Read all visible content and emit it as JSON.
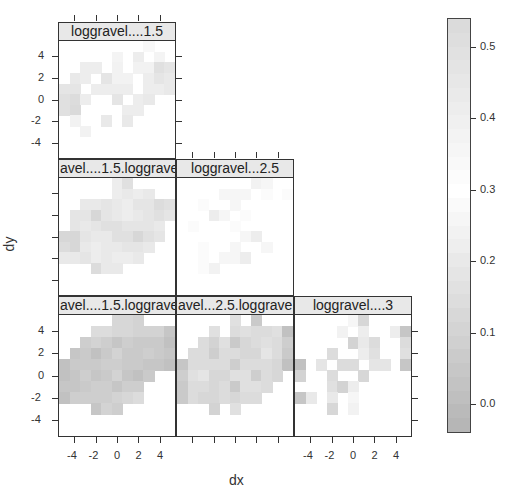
{
  "chart_data": {
    "type": "heatmap",
    "layout": "lower-triangular scatterplot-matrix of variogram-map panels",
    "xlabel": "dx",
    "ylabel": "dy",
    "x_ticks": [
      -4,
      -2,
      0,
      2,
      4
    ],
    "y_ticks": [
      -4,
      -2,
      0,
      2,
      4
    ],
    "axis_range": [
      -5.5,
      5.5
    ],
    "colorbar": {
      "ticks": [
        0.0,
        0.1,
        0.2,
        0.3,
        0.4,
        0.5
      ],
      "range": [
        -0.04,
        0.54
      ],
      "low_color": "#b4b4b4",
      "high_color": "#d9d9d9",
      "mid_color": "#ffffff"
    },
    "panels": [
      {
        "title": "loggravel....1.5",
        "row": 0,
        "col": 0,
        "grid_note": "rows top(dy=5) to bottom(dy=-5), cols left(dx=-5) to right(dx=5)",
        "values": [
          [
            null,
            null,
            null,
            null,
            null,
            null,
            null,
            null,
            0.27,
            null,
            null
          ],
          [
            null,
            null,
            null,
            null,
            null,
            0.25,
            null,
            0.22,
            null,
            0.25,
            null
          ],
          [
            null,
            null,
            0.22,
            0.22,
            null,
            0.24,
            null,
            0.24,
            0.24,
            0.16,
            0.18
          ],
          [
            null,
            0.2,
            0.22,
            null,
            0.18,
            0.24,
            0.24,
            null,
            0.22,
            0.18,
            0.2
          ],
          [
            0.18,
            0.18,
            null,
            0.22,
            0.22,
            0.22,
            0.22,
            null,
            0.22,
            0.22,
            0.2
          ],
          [
            0.16,
            0.14,
            0.22,
            null,
            null,
            0.18,
            null,
            0.22,
            0.2,
            null,
            null
          ],
          [
            0.16,
            0.13,
            null,
            null,
            null,
            null,
            0.22,
            0.22,
            null,
            null,
            null
          ],
          [
            null,
            0.24,
            null,
            null,
            0.2,
            null,
            0.2,
            null,
            null,
            null,
            null
          ],
          [
            null,
            null,
            0.24,
            null,
            null,
            null,
            null,
            null,
            null,
            null,
            null
          ],
          [
            null,
            null,
            null,
            null,
            null,
            null,
            null,
            null,
            null,
            null,
            null
          ],
          [
            null,
            null,
            null,
            null,
            null,
            null,
            null,
            null,
            null,
            null,
            null
          ]
        ]
      },
      {
        "title": "avel....1.5.loggrave",
        "row": 1,
        "col": 0,
        "values": [
          [
            null,
            null,
            null,
            null,
            null,
            0.22,
            0.16,
            null,
            null,
            null,
            null
          ],
          [
            null,
            null,
            null,
            null,
            null,
            0.22,
            0.2,
            0.22,
            0.2,
            null,
            null
          ],
          [
            null,
            null,
            0.2,
            0.2,
            0.18,
            0.2,
            0.22,
            0.18,
            0.18,
            0.14,
            0.16
          ],
          [
            null,
            0.18,
            0.18,
            0.12,
            0.18,
            0.2,
            0.22,
            0.2,
            0.18,
            0.16,
            0.18
          ],
          [
            null,
            0.18,
            0.2,
            0.18,
            0.16,
            0.16,
            0.18,
            0.18,
            0.18,
            0.2,
            null
          ],
          [
            0.12,
            0.12,
            0.18,
            0.2,
            0.2,
            0.16,
            0.16,
            0.12,
            0.16,
            0.18,
            null
          ],
          [
            0.14,
            0.12,
            0.2,
            0.22,
            0.2,
            0.2,
            0.18,
            0.18,
            0.2,
            null,
            null
          ],
          [
            0.2,
            0.2,
            0.18,
            0.22,
            0.2,
            0.22,
            0.22,
            0.2,
            null,
            null,
            null
          ],
          [
            null,
            null,
            null,
            0.14,
            0.2,
            0.2,
            null,
            null,
            null,
            null,
            null
          ],
          [
            null,
            null,
            null,
            null,
            null,
            null,
            null,
            null,
            null,
            null,
            null
          ],
          [
            null,
            null,
            null,
            null,
            null,
            null,
            null,
            null,
            null,
            null,
            null
          ]
        ]
      },
      {
        "title": "loggravel...2.5",
        "row": 1,
        "col": 1,
        "values": [
          [
            null,
            null,
            null,
            null,
            null,
            null,
            null,
            0.24,
            0.26,
            null,
            null
          ],
          [
            null,
            null,
            null,
            null,
            0.26,
            0.26,
            0.26,
            null,
            0.28,
            null,
            0.28
          ],
          [
            null,
            null,
            0.28,
            null,
            null,
            0.26,
            null,
            null,
            null,
            null,
            null
          ],
          [
            null,
            null,
            null,
            0.22,
            0.26,
            null,
            0.28,
            null,
            null,
            null,
            null
          ],
          [
            null,
            0.28,
            null,
            null,
            null,
            0.28,
            null,
            null,
            null,
            null,
            null
          ],
          [
            null,
            null,
            null,
            null,
            null,
            null,
            0.26,
            0.22,
            null,
            null,
            null
          ],
          [
            null,
            null,
            0.28,
            null,
            null,
            0.26,
            null,
            null,
            0.26,
            null,
            null
          ],
          [
            null,
            null,
            0.28,
            null,
            0.26,
            0.26,
            0.22,
            null,
            null,
            null,
            null
          ],
          [
            null,
            null,
            0.28,
            0.24,
            null,
            null,
            null,
            null,
            null,
            null,
            null
          ],
          [
            null,
            null,
            null,
            null,
            null,
            null,
            null,
            null,
            null,
            null,
            null
          ],
          [
            null,
            null,
            null,
            null,
            null,
            null,
            null,
            null,
            null,
            null,
            null
          ]
        ]
      },
      {
        "title": "avel....1.5.loggrave",
        "row": 2,
        "col": 0,
        "values": [
          [
            null,
            null,
            null,
            null,
            null,
            0.12,
            0.12,
            0.1,
            null,
            null,
            null
          ],
          [
            null,
            null,
            null,
            0.14,
            0.14,
            0.12,
            0.12,
            0.1,
            0.1,
            0.1,
            0.04
          ],
          [
            null,
            null,
            0.08,
            0.1,
            0.08,
            0.04,
            0.08,
            0.06,
            0.06,
            0.06,
            0.02
          ],
          [
            null,
            0.04,
            0.06,
            0.02,
            0.06,
            0.1,
            0.06,
            0.06,
            0.08,
            0.06,
            0.04
          ],
          [
            0.02,
            0.06,
            0.06,
            0.06,
            0.08,
            0.08,
            0.06,
            0.06,
            0.04,
            0.04,
            0.02
          ],
          [
            0.02,
            0.04,
            0.08,
            0.04,
            0.06,
            0.1,
            0.04,
            0.02,
            0.06,
            null,
            null
          ],
          [
            0.04,
            0.04,
            0.06,
            0.08,
            0.08,
            0.04,
            0.08,
            0.08,
            null,
            null,
            null
          ],
          [
            0.02,
            0.08,
            0.08,
            0.08,
            0.08,
            0.1,
            0.12,
            0.14,
            null,
            null,
            null
          ],
          [
            null,
            null,
            null,
            0.04,
            0.1,
            0.08,
            null,
            null,
            null,
            null,
            null
          ],
          [
            null,
            null,
            null,
            null,
            null,
            null,
            null,
            null,
            null,
            null,
            null
          ],
          [
            null,
            null,
            null,
            null,
            null,
            null,
            null,
            null,
            null,
            null,
            null
          ]
        ]
      },
      {
        "title": "avel...2.5.loggrave",
        "row": 2,
        "col": 1,
        "values": [
          [
            null,
            null,
            null,
            null,
            null,
            0.16,
            null,
            0.06,
            null,
            null,
            null
          ],
          [
            null,
            null,
            null,
            0.16,
            null,
            0.14,
            0.16,
            0.14,
            0.14,
            0.16,
            0.02
          ],
          [
            null,
            null,
            0.14,
            0.1,
            0.16,
            0.06,
            0.12,
            0.14,
            0.16,
            0.14,
            0.08
          ],
          [
            null,
            0.14,
            0.14,
            0.08,
            0.14,
            0.14,
            0.12,
            0.12,
            0.18,
            0.14,
            0.06
          ],
          [
            0.04,
            0.14,
            0.14,
            0.14,
            0.14,
            0.08,
            0.14,
            0.14,
            0.14,
            0.12,
            0.02
          ],
          [
            0.08,
            0.16,
            0.18,
            0.12,
            0.12,
            0.16,
            0.16,
            0.08,
            0.14,
            0.12,
            null
          ],
          [
            0.06,
            0.14,
            0.14,
            0.12,
            0.14,
            0.06,
            0.16,
            0.16,
            0.14,
            null,
            null
          ],
          [
            0.06,
            0.14,
            0.12,
            0.12,
            0.14,
            0.12,
            0.14,
            0.14,
            null,
            null,
            null
          ],
          [
            null,
            null,
            null,
            0.1,
            null,
            0.16,
            null,
            null,
            null,
            null,
            null
          ],
          [
            null,
            null,
            null,
            null,
            null,
            null,
            null,
            null,
            null,
            null,
            null
          ],
          [
            null,
            null,
            null,
            null,
            null,
            null,
            null,
            null,
            null,
            null,
            null
          ]
        ]
      },
      {
        "title": "loggravel....3",
        "row": 2,
        "col": 2,
        "values": [
          [
            null,
            null,
            null,
            null,
            null,
            0.26,
            0.12,
            null,
            null,
            null,
            null
          ],
          [
            null,
            null,
            null,
            null,
            0.24,
            null,
            0.22,
            null,
            null,
            0.22,
            0.04
          ],
          [
            null,
            null,
            null,
            null,
            null,
            0.1,
            0.2,
            0.14,
            null,
            null,
            0.14
          ],
          [
            null,
            null,
            null,
            0.14,
            null,
            null,
            0.22,
            0.16,
            null,
            null,
            0.16
          ],
          [
            0.02,
            null,
            0.18,
            null,
            0.14,
            0.14,
            null,
            0.18,
            0.18,
            null,
            0.04
          ],
          [
            0.1,
            null,
            null,
            0.14,
            null,
            null,
            0.12,
            null,
            null,
            null,
            null
          ],
          [
            null,
            null,
            null,
            0.16,
            0.1,
            0.22,
            null,
            null,
            null,
            null,
            null
          ],
          [
            0.04,
            0.2,
            null,
            0.2,
            null,
            0.26,
            null,
            null,
            null,
            null,
            null
          ],
          [
            null,
            null,
            null,
            0.12,
            null,
            0.24,
            null,
            null,
            null,
            null,
            null
          ],
          [
            null,
            null,
            null,
            null,
            null,
            null,
            null,
            null,
            null,
            null,
            null
          ],
          [
            null,
            null,
            null,
            null,
            null,
            null,
            null,
            null,
            null,
            null,
            null
          ]
        ]
      }
    ]
  },
  "labels": {
    "xlabel": "dx",
    "ylabel": "dy",
    "panel_titles": [
      "loggravel....1.5",
      "avel....1.5.loggrave",
      "loggravel...2.5",
      "avel....1.5.loggrave",
      "avel...2.5.loggrave",
      "loggravel....3"
    ],
    "x_tick_labels": [
      "-4",
      "-2",
      "0",
      "2",
      "4"
    ],
    "y_tick_labels": [
      "4",
      "2",
      "0",
      "-2",
      "-4"
    ],
    "colorbar_labels": [
      "0.5",
      "0.4",
      "0.3",
      "0.2",
      "0.1",
      "0.0"
    ]
  }
}
